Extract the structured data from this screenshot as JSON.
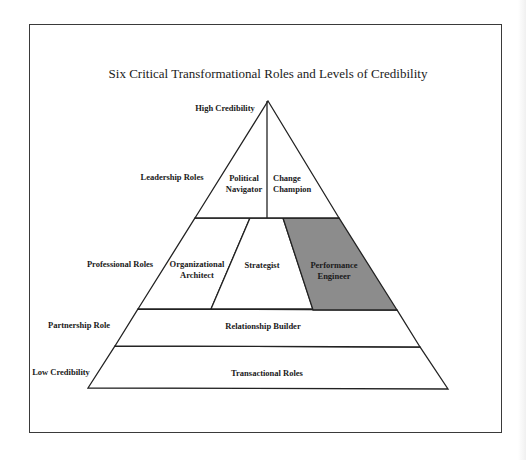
{
  "title": "Six Critical Transformational Roles and Levels of Credibility",
  "colors": {
    "outline": "#222222",
    "highlight_fill": "#8c8c8c",
    "background": "#ffffff"
  },
  "axis": {
    "top_label": "High Credibility",
    "bottom_label": "Low Credibility"
  },
  "tiers": [
    {
      "label": "Leadership Roles",
      "roles": [
        {
          "line1": "Political",
          "line2": "Navigator",
          "highlighted": false
        },
        {
          "line1": "Change",
          "line2": "Champion",
          "highlighted": false
        }
      ]
    },
    {
      "label": "Professional Roles",
      "roles": [
        {
          "line1": "Organizational",
          "line2": "Architect",
          "highlighted": false
        },
        {
          "line1": "Strategist",
          "line2": "",
          "highlighted": false
        },
        {
          "line1": "Performance",
          "line2": "Engineer",
          "highlighted": true
        }
      ]
    },
    {
      "label": "Partnership Role",
      "roles": [
        {
          "line1": "Relationship Builder",
          "line2": "",
          "highlighted": false
        }
      ]
    },
    {
      "label": "",
      "roles": [
        {
          "line1": "Transactional Roles",
          "line2": "",
          "highlighted": false
        }
      ]
    }
  ]
}
